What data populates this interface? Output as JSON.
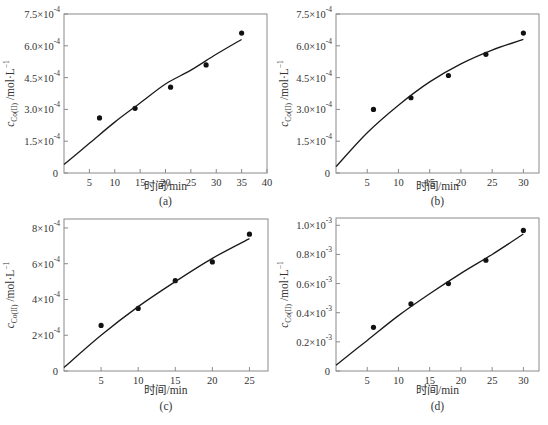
{
  "chart_data": [
    {
      "type": "scatter",
      "panel_label": "(a)",
      "xlabel": "时间/min",
      "ylabel": "c_{Co(II)} /mol·L⁻¹",
      "xlim": [
        0,
        40
      ],
      "ylim": [
        0,
        0.00075
      ],
      "xticks": [
        5,
        10,
        15,
        20,
        25,
        30,
        35,
        40
      ],
      "yticks": [
        {
          "value": 0,
          "label": "0"
        },
        {
          "value": 0.00015,
          "label": "1.5×10",
          "exp": "-4"
        },
        {
          "value": 0.0003,
          "label": "3.0×10",
          "exp": "-4"
        },
        {
          "value": 0.00045,
          "label": "4.5×10",
          "exp": "-4"
        },
        {
          "value": 0.0006,
          "label": "6.0×10",
          "exp": "-4"
        },
        {
          "value": 0.00075,
          "label": "7.5×10",
          "exp": "-4"
        }
      ],
      "series": [
        {
          "name": "experimental",
          "kind": "points",
          "x": [
            7,
            14,
            21,
            28,
            35
          ],
          "y": [
            0.00026,
            0.000305,
            0.000405,
            0.00051,
            0.00066
          ]
        },
        {
          "name": "model",
          "kind": "line",
          "x": [
            0,
            5,
            10,
            15,
            20,
            25,
            30,
            35
          ],
          "y": [
            4e-05,
            0.00014,
            0.00024,
            0.00033,
            0.00042,
            0.000485,
            0.00056,
            0.00063
          ]
        }
      ]
    },
    {
      "type": "scatter",
      "panel_label": "(b)",
      "xlabel": "时间/min",
      "ylabel": "c_{Co(II)} /mol·L⁻¹",
      "xlim": [
        0,
        32.5
      ],
      "ylim": [
        0,
        0.00075
      ],
      "xticks": [
        5,
        10,
        15,
        20,
        25,
        30
      ],
      "yticks": [
        {
          "value": 0,
          "label": "0"
        },
        {
          "value": 0.00015,
          "label": "1.5×10",
          "exp": "-4"
        },
        {
          "value": 0.0003,
          "label": "3.0×10",
          "exp": "-4"
        },
        {
          "value": 0.00045,
          "label": "4.5×10",
          "exp": "-4"
        },
        {
          "value": 0.0006,
          "label": "6.0×10",
          "exp": "-4"
        },
        {
          "value": 0.00075,
          "label": "7.5×10",
          "exp": "-4"
        }
      ],
      "series": [
        {
          "name": "experimental",
          "kind": "points",
          "x": [
            6,
            12,
            18,
            24,
            30
          ],
          "y": [
            0.0003,
            0.000355,
            0.00046,
            0.00056,
            0.00066
          ]
        },
        {
          "name": "model",
          "kind": "line",
          "x": [
            0,
            5,
            10,
            15,
            20,
            25,
            30
          ],
          "y": [
            3e-05,
            0.00019,
            0.00032,
            0.00043,
            0.000515,
            0.00058,
            0.00063
          ]
        }
      ]
    },
    {
      "type": "scatter",
      "panel_label": "(c)",
      "xlabel": "时间/min",
      "ylabel": "c_{Co(II)} /mol·L⁻¹",
      "xlim": [
        0,
        27.5
      ],
      "ylim": [
        0,
        0.00085
      ],
      "xticks": [
        5,
        10,
        15,
        20,
        25
      ],
      "yticks": [
        {
          "value": 0,
          "label": "0"
        },
        {
          "value": 0.0002,
          "label": "2×10",
          "exp": "-4"
        },
        {
          "value": 0.0004,
          "label": "4×10",
          "exp": "-4"
        },
        {
          "value": 0.0006,
          "label": "6×10",
          "exp": "-4"
        },
        {
          "value": 0.0008,
          "label": "8×10",
          "exp": "-4"
        }
      ],
      "series": [
        {
          "name": "experimental",
          "kind": "points",
          "x": [
            5,
            10,
            15,
            20,
            25
          ],
          "y": [
            0.000255,
            0.00035,
            0.000505,
            0.00061,
            0.000765
          ]
        },
        {
          "name": "model",
          "kind": "line",
          "x": [
            0,
            5,
            10,
            15,
            20,
            25
          ],
          "y": [
            2e-05,
            0.0002,
            0.00036,
            0.0005,
            0.00063,
            0.00074
          ]
        }
      ]
    },
    {
      "type": "scatter",
      "panel_label": "(d)",
      "xlabel": "时间/min",
      "ylabel": "c_{Co(II)} /mol·L⁻¹",
      "xlim": [
        0,
        32.5
      ],
      "ylim": [
        0,
        0.00105
      ],
      "xticks": [
        5,
        10,
        15,
        20,
        25,
        30
      ],
      "yticks": [
        {
          "value": 0,
          "label": "0"
        },
        {
          "value": 0.0002,
          "label": "0.2×10",
          "exp": "-3"
        },
        {
          "value": 0.0004,
          "label": "0.4×10",
          "exp": "-3"
        },
        {
          "value": 0.0006,
          "label": "0.6×10",
          "exp": "-3"
        },
        {
          "value": 0.0008,
          "label": "0.8×10",
          "exp": "-3"
        },
        {
          "value": 0.001,
          "label": "1.0×10",
          "exp": "-3"
        }
      ],
      "series": [
        {
          "name": "experimental",
          "kind": "points",
          "x": [
            6,
            12,
            18,
            24,
            30
          ],
          "y": [
            0.0003,
            0.00046,
            0.0006,
            0.00076,
            0.000965
          ]
        },
        {
          "name": "model",
          "kind": "line",
          "x": [
            0,
            5,
            10,
            15,
            20,
            25,
            30
          ],
          "y": [
            4e-05,
            0.00021,
            0.00038,
            0.00053,
            0.00067,
            0.0008,
            0.00094
          ]
        }
      ]
    }
  ],
  "panels": [
    {
      "label": "(a)",
      "xlabel": "时间/min",
      "ylabel_main": "c",
      "ylabel_sub": "Co(II)",
      "ylabel_unit": " /mol·L",
      "ylabel_exp": "−1"
    },
    {
      "label": "(b)",
      "xlabel": "时间/min",
      "ylabel_main": "c",
      "ylabel_sub": "Co(II)",
      "ylabel_unit": " /mol·L",
      "ylabel_exp": "−1"
    },
    {
      "label": "(c)",
      "xlabel": "时间/min",
      "ylabel_main": "c",
      "ylabel_sub": "Co(II)",
      "ylabel_unit": " /mol·L",
      "ylabel_exp": "−1"
    },
    {
      "label": "(d)",
      "xlabel": "时间/min",
      "ylabel_main": "c",
      "ylabel_sub": "Co(II)",
      "ylabel_unit": " /mol·L",
      "ylabel_exp": "−1"
    }
  ],
  "colors": {
    "frame": "#8a8a8a",
    "line": "#1a1a1a",
    "point": "#111111",
    "text": "#333333"
  }
}
